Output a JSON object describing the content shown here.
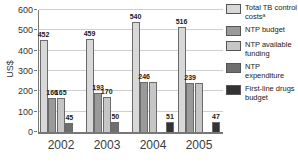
{
  "chart_data": {
    "type": "bar",
    "title": "",
    "ylabel": "US$",
    "ylim": [
      0,
      600
    ],
    "yticks": [
      0,
      100,
      200,
      300,
      400,
      500,
      600
    ],
    "grid": true,
    "legend_position": "right",
    "categories": [
      "2002",
      "2003",
      "2004",
      "2005"
    ],
    "series": [
      {
        "name": "Total TB control costsᵃ",
        "key": "total-tb-control-costs",
        "color": "#d8d8d8",
        "values": [
          452,
          459,
          540,
          516
        ]
      },
      {
        "name": "NTP budget",
        "key": "ntp-budget",
        "color": "#9a9a9a",
        "values": [
          166,
          193,
          246,
          239
        ]
      },
      {
        "name": "NTP available funding",
        "key": "ntp-available-funding",
        "color": "#c6c6c6",
        "values": [
          165,
          170,
          246,
          239
        ]
      },
      {
        "name": "NTP expenditure",
        "key": "ntp-expenditure",
        "color": "#6e6e6e",
        "values": [
          45,
          50,
          null,
          null
        ]
      },
      {
        "name": "First-line drugs budget",
        "key": "first-line-drugs-budget",
        "color": "#333333",
        "values": [
          null,
          null,
          51,
          47
        ]
      }
    ],
    "value_labels": [
      [
        "452",
        "166",
        "165",
        "45",
        ""
      ],
      [
        "459",
        "193",
        "170",
        "50",
        ""
      ],
      [
        "540",
        "246",
        "",
        "",
        "51"
      ],
      [
        "516",
        "239",
        "",
        "",
        "47"
      ]
    ]
  }
}
